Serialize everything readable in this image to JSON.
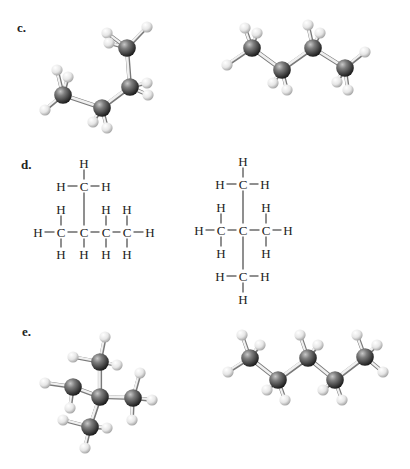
{
  "sections": [
    {
      "label": "c.",
      "label_pos": [
        17,
        20
      ],
      "models": [
        {
          "kind": "ball-and-stick",
          "carbons": [
            [
              63,
              95
            ],
            [
              102,
              108
            ],
            [
              130,
              87
            ],
            [
              127,
              48
            ]
          ],
          "cc_bonds": [
            [
              0,
              1
            ],
            [
              1,
              2
            ],
            [
              2,
              3
            ]
          ],
          "hydrogens": [
            [
              57,
              70,
              0
            ],
            [
              68,
              77,
              0
            ],
            [
              45,
              110,
              0
            ],
            [
              107,
              33,
              3
            ],
            [
              109,
              43,
              3
            ],
            [
              147,
              27,
              3
            ],
            [
              147,
              83,
              2
            ],
            [
              148,
              95,
              2
            ],
            [
              93,
              122,
              1
            ],
            [
              107,
              128,
              1
            ]
          ]
        },
        {
          "kind": "ball-and-stick",
          "carbons": [
            [
              252,
              48
            ],
            [
              282,
              70
            ],
            [
              313,
              48
            ],
            [
              345,
              68
            ]
          ],
          "cc_bonds": [
            [
              0,
              1
            ],
            [
              1,
              2
            ],
            [
              2,
              3
            ]
          ],
          "hydrogens": [
            [
              245,
              28,
              0
            ],
            [
              257,
              33,
              0
            ],
            [
              227,
              65,
              0
            ],
            [
              308,
              25,
              2
            ],
            [
              320,
              33,
              2
            ],
            [
              365,
              52,
              3
            ],
            [
              273,
              83,
              1
            ],
            [
              287,
              90,
              1
            ],
            [
              337,
              82,
              3
            ],
            [
              348,
              90,
              3
            ]
          ]
        }
      ]
    },
    {
      "label": "d.",
      "label_pos": [
        21,
        157
      ],
      "models": [
        {
          "kind": "structural-formula",
          "atoms": [
            {
              "s": "H",
              "x": 84,
              "y": 163
            },
            {
              "s": "H",
              "x": 61,
              "y": 186
            },
            {
              "s": "C",
              "x": 84,
              "y": 186
            },
            {
              "s": "H",
              "x": 106,
              "y": 186
            },
            {
              "s": "H",
              "x": 61,
              "y": 209
            },
            {
              "s": "H",
              "x": 106,
              "y": 209
            },
            {
              "s": "H",
              "x": 127,
              "y": 209
            },
            {
              "s": "H",
              "x": 38,
              "y": 232
            },
            {
              "s": "C",
              "x": 61,
              "y": 232
            },
            {
              "s": "C",
              "x": 84,
              "y": 232
            },
            {
              "s": "C",
              "x": 106,
              "y": 232
            },
            {
              "s": "C",
              "x": 127,
              "y": 232
            },
            {
              "s": "H",
              "x": 150,
              "y": 232
            },
            {
              "s": "H",
              "x": 61,
              "y": 254
            },
            {
              "s": "H",
              "x": 84,
              "y": 254
            },
            {
              "s": "H",
              "x": 106,
              "y": 254
            },
            {
              "s": "H",
              "x": 127,
              "y": 254
            }
          ],
          "bonds": [
            [
              0,
              2
            ],
            [
              1,
              2
            ],
            [
              2,
              3
            ],
            [
              2,
              9
            ],
            [
              4,
              8
            ],
            [
              5,
              10
            ],
            [
              6,
              11
            ],
            [
              7,
              8
            ],
            [
              8,
              9
            ],
            [
              9,
              10
            ],
            [
              10,
              11
            ],
            [
              11,
              12
            ],
            [
              8,
              13
            ],
            [
              9,
              14
            ],
            [
              10,
              15
            ],
            [
              11,
              16
            ]
          ]
        },
        {
          "kind": "structural-formula",
          "atoms": [
            {
              "s": "H",
              "x": 243,
              "y": 161
            },
            {
              "s": "H",
              "x": 220,
              "y": 184
            },
            {
              "s": "C",
              "x": 243,
              "y": 184
            },
            {
              "s": "H",
              "x": 265,
              "y": 184
            },
            {
              "s": "H",
              "x": 221,
              "y": 207
            },
            {
              "s": "H",
              "x": 266,
              "y": 207
            },
            {
              "s": "H",
              "x": 199,
              "y": 230
            },
            {
              "s": "C",
              "x": 221,
              "y": 230
            },
            {
              "s": "C",
              "x": 243,
              "y": 230
            },
            {
              "s": "C",
              "x": 266,
              "y": 230
            },
            {
              "s": "H",
              "x": 288,
              "y": 230
            },
            {
              "s": "H",
              "x": 221,
              "y": 253
            },
            {
              "s": "H",
              "x": 266,
              "y": 253
            },
            {
              "s": "H",
              "x": 220,
              "y": 276
            },
            {
              "s": "C",
              "x": 243,
              "y": 276
            },
            {
              "s": "H",
              "x": 265,
              "y": 276
            },
            {
              "s": "H",
              "x": 243,
              "y": 299
            }
          ],
          "bonds": [
            [
              0,
              2
            ],
            [
              1,
              2
            ],
            [
              2,
              3
            ],
            [
              2,
              8
            ],
            [
              4,
              7
            ],
            [
              5,
              9
            ],
            [
              6,
              7
            ],
            [
              7,
              8
            ],
            [
              8,
              9
            ],
            [
              9,
              10
            ],
            [
              7,
              11
            ],
            [
              9,
              12
            ],
            [
              8,
              14
            ],
            [
              13,
              14
            ],
            [
              14,
              15
            ],
            [
              14,
              16
            ]
          ]
        }
      ]
    },
    {
      "label": "e.",
      "label_pos": [
        22,
        324
      ],
      "models": [
        {
          "kind": "ball-and-stick",
          "carbons": [
            [
              100,
              397
            ],
            [
              100,
              362
            ],
            [
              73,
              387
            ],
            [
              133,
              398
            ],
            [
              90,
              427
            ]
          ],
          "cc_bonds": [
            [
              0,
              1
            ],
            [
              0,
              2
            ],
            [
              0,
              3
            ],
            [
              0,
              4
            ]
          ],
          "hydrogens": [
            [
              105,
              337,
              1
            ],
            [
              73,
              357,
              1
            ],
            [
              117,
              365,
              1
            ],
            [
              45,
              383,
              2
            ],
            [
              70,
              408,
              2
            ],
            [
              140,
              373,
              3
            ],
            [
              152,
              400,
              3
            ],
            [
              132,
              420,
              3
            ],
            [
              63,
              420,
              4
            ],
            [
              107,
              428,
              4
            ],
            [
              85,
              448,
              4
            ]
          ]
        },
        {
          "kind": "ball-and-stick",
          "carbons": [
            [
              250,
              358
            ],
            [
              278,
              380
            ],
            [
              308,
              358
            ],
            [
              335,
              380
            ],
            [
              365,
              357
            ]
          ],
          "cc_bonds": [
            [
              0,
              1
            ],
            [
              1,
              2
            ],
            [
              2,
              3
            ],
            [
              3,
              4
            ]
          ],
          "hydrogens": [
            [
              242,
              335,
              0
            ],
            [
              260,
              345,
              0
            ],
            [
              228,
              372,
              0
            ],
            [
              300,
              335,
              2
            ],
            [
              318,
              345,
              2
            ],
            [
              357,
              335,
              4
            ],
            [
              377,
              345,
              4
            ],
            [
              383,
              372,
              4
            ],
            [
              267,
              390,
              1
            ],
            [
              285,
              400,
              1
            ],
            [
              323,
              390,
              3
            ],
            [
              342,
              400,
              3
            ]
          ]
        }
      ]
    }
  ],
  "colors": {
    "carbon_light": "#9a9a9a",
    "carbon_dark": "#2a2a2a",
    "hydrogen_light": "#f4f4f4",
    "hydrogen_dark": "#b5b5b5",
    "stick_light": "#f0f0f0",
    "stick_dark": "#7a7a7a",
    "text": "#222222"
  }
}
